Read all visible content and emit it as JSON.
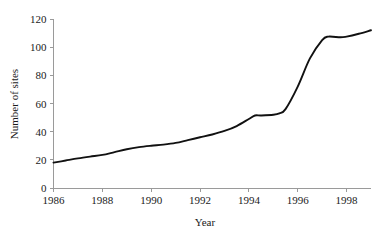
{
  "chart_data": {
    "type": "line",
    "title": "",
    "xlabel": "Year",
    "ylabel": "Number of sites",
    "xlim": [
      1986,
      1999
    ],
    "ylim": [
      0,
      120
    ],
    "grid": false,
    "legend": false,
    "x_ticks": [
      1986,
      1988,
      1990,
      1992,
      1994,
      1996,
      1998
    ],
    "y_ticks": [
      0,
      20,
      40,
      60,
      80,
      100,
      120
    ],
    "x_tick_labels": [
      "1986",
      "1988",
      "1990",
      "1992",
      "1994",
      "1996",
      "1998"
    ],
    "y_tick_labels": [
      "0",
      "20",
      "40",
      "60",
      "80",
      "100",
      "120"
    ],
    "line_color": "#111111",
    "axis_color": "#9a9a9a",
    "series": [
      {
        "name": "Number of sites",
        "x": [
          1986,
          1986.5,
          1987,
          1987.5,
          1988,
          1988.5,
          1989,
          1989.5,
          1990,
          1990.5,
          1991,
          1991.5,
          1992,
          1992.5,
          1993,
          1993.5,
          1994,
          1994.25,
          1994.5,
          1995,
          1995.25,
          1995.5,
          1996,
          1996.5,
          1997,
          1997.25,
          1997.75,
          1998,
          1998.5,
          1999
        ],
        "values": [
          18,
          19.5,
          21,
          22.3,
          23.5,
          25.5,
          27.5,
          29,
          30,
          30.8,
          32,
          34,
          36,
          38,
          40.5,
          44,
          49,
          51.5,
          51.5,
          52,
          53,
          56,
          72,
          92,
          105,
          107.5,
          107,
          107.5,
          109.5,
          112
        ]
      }
    ]
  }
}
